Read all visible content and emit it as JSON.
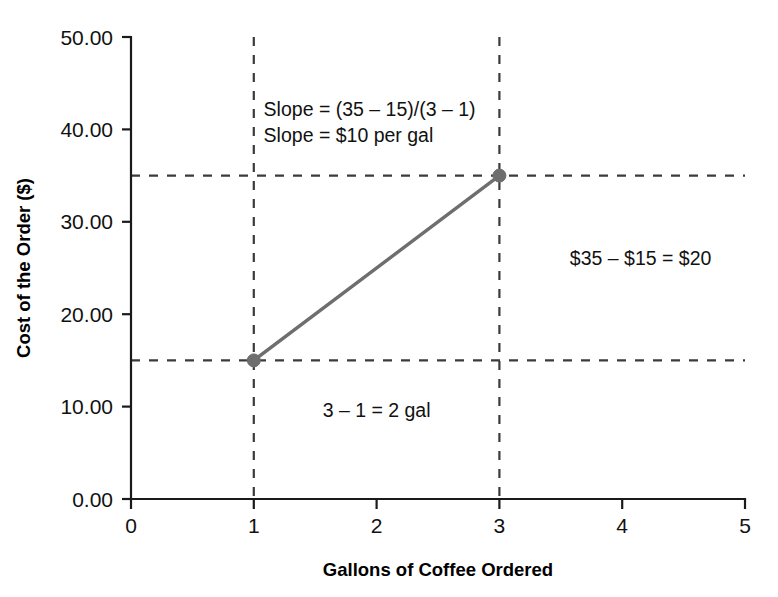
{
  "chart_data": {
    "type": "line",
    "title": "",
    "xlabel": "Gallons of Coffee Ordered",
    "ylabel": "Cost of the Order ($)",
    "xlim": [
      0,
      5
    ],
    "ylim": [
      0,
      50
    ],
    "grid": false,
    "legend": "none",
    "x": [
      1,
      3
    ],
    "values": [
      15,
      35
    ],
    "series": [
      {
        "name": "Cost of the Order",
        "x": [
          1,
          3
        ],
        "values": [
          15,
          35
        ],
        "color": "#6e6e6e",
        "marker": "circle"
      }
    ],
    "x_ticks": [
      "0",
      "1",
      "2",
      "3",
      "4",
      "5"
    ],
    "x_tick_values": [
      0,
      1,
      2,
      3,
      4,
      5
    ],
    "y_ticks": [
      "0.00",
      "10.00",
      "20.00",
      "30.00",
      "40.00",
      "50.00"
    ],
    "y_tick_values": [
      0,
      10,
      20,
      30,
      40,
      50
    ],
    "guides": {
      "vertical_values": [
        1,
        3
      ],
      "horizontal_values": [
        15,
        35
      ],
      "style": "dashed",
      "color": "#3b3b3b"
    },
    "annotations": [
      {
        "id": "slope-formula-line1",
        "text": "Slope = (35 – 15)/(3 – 1)",
        "x": 1.08,
        "y": 41.5,
        "align": "start"
      },
      {
        "id": "slope-formula-line2",
        "text": "Slope = $10 per gal",
        "x": 1.08,
        "y": 38.6,
        "align": "start"
      },
      {
        "id": "rise-label",
        "text": "$35 – $15 = $20",
        "x": 4.15,
        "y": 25.3,
        "align": "middle"
      },
      {
        "id": "run-label",
        "text": "3 – 1 = 2 gal",
        "x": 2.0,
        "y": 8.9,
        "align": "middle"
      }
    ]
  },
  "colors": {
    "axis": "#1a1a1a",
    "guide": "#3b3b3b",
    "series": "#6e6e6e",
    "text": "#111111",
    "background": "#ffffff"
  }
}
